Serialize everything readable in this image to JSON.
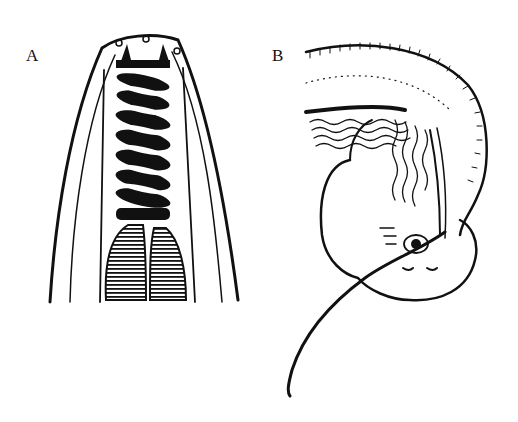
{
  "figure": {
    "panels": [
      {
        "label": "A",
        "description": "Anterior end with spiral stylet/buccal armature"
      },
      {
        "label": "B",
        "description": "Curved body region with coiled spicule"
      }
    ]
  },
  "colors": {
    "ink": "#111111",
    "paper": "#ffffff"
  }
}
